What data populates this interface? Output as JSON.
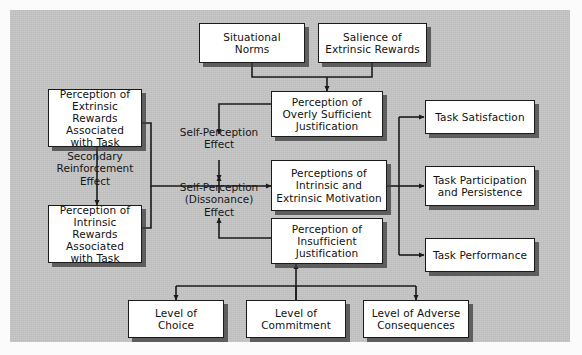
{
  "diagram": {
    "background_color": "#c6c6c6",
    "box_fill": "#ffffff",
    "box_border": "#1b1b1b",
    "shadow_color": "#3c3c3c",
    "nodes": [
      {
        "id": "situational-norms",
        "label": "Situational\nNorms"
      },
      {
        "id": "salience-extrinsic",
        "label": "Salience of\nExtrinsic Rewards"
      },
      {
        "id": "perception-extrinsic",
        "label": "Perception of\nExtrinsic Rewards\nAssociated\nwith Task"
      },
      {
        "id": "perception-intrinsic",
        "label": "Perception of\nIntrinsic Rewards\nAssociated\nwith Task"
      },
      {
        "id": "overly-sufficient",
        "label": "Perception of\nOverly Sufficient\nJustification"
      },
      {
        "id": "perceptions-motivation",
        "label": "Perceptions of\nIntrinsic and\nExtrinsic Motivation"
      },
      {
        "id": "insufficient",
        "label": "Perception of\nInsufficient\nJustification"
      },
      {
        "id": "task-satisfaction",
        "label": "Task Satisfaction"
      },
      {
        "id": "task-participation",
        "label": "Task Participation\nand Persistence"
      },
      {
        "id": "task-performance",
        "label": "Task Performance"
      },
      {
        "id": "level-choice",
        "label": "Level of\nChoice"
      },
      {
        "id": "level-commitment",
        "label": "Level of\nCommitment"
      },
      {
        "id": "level-adverse",
        "label": "Level of Adverse\nConsequences"
      }
    ],
    "edge_labels": [
      {
        "id": "secondary-reinforcement",
        "label": "Secondary\nReinforcement\nEffect"
      },
      {
        "id": "self-perception",
        "label": "Self-Perception\nEffect"
      },
      {
        "id": "self-perception-diss",
        "label": "Self-Perception\n(Dissonance)\nEffect"
      }
    ]
  }
}
